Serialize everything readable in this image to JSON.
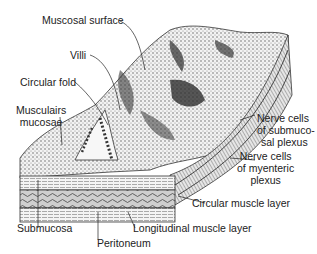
{
  "diagram": {
    "labels": {
      "mucosal_surface": "Muscosal surface",
      "villi": "Villi",
      "circular_fold": "Circular fold",
      "muscularis_mucosae_1": "Musculairs",
      "muscularis_mucosae_2": "mucosae",
      "submucosal_plexus_1": "Nerve cells",
      "submucosal_plexus_2": "of submuco-",
      "submucosal_plexus_3": "sal plexus",
      "myenteric_plexus_1": "Nerve cells",
      "myenteric_plexus_2": "of myenteric",
      "myenteric_plexus_3": "plexus",
      "circular_muscle": "Circular muscle layer",
      "submucosa": "Submucosa",
      "longitudinal_muscle": "Longitudinal muscle layer",
      "peritoneum": "Peritoneum"
    },
    "colors": {
      "ink": "#222222",
      "background": "#ffffff",
      "shade_dark": "#3a3a3a",
      "shade_mid": "#9a9a9a",
      "shade_light": "#d8d8d8"
    }
  }
}
